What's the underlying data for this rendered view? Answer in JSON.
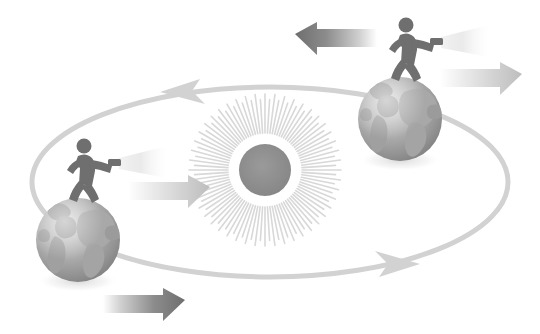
{
  "diagram": {
    "canvas": {
      "width": 540,
      "height": 334,
      "background": "#ffffff"
    },
    "palette": {
      "background": "#ffffff",
      "orbit_line": "#d2d2d2",
      "sun_core": "#8c8c8c",
      "sun_rays": "#d8d8d8",
      "globe_ocean_light": "#c9c9c9",
      "globe_ocean_dark": "#8e8e8e",
      "globe_land": "#a7a7a7",
      "figure_body": "#6f6f6f",
      "arrow_dark": "#777777",
      "arrow_mid": "#9b9b9b",
      "arrow_light": "#c4c4c4",
      "beam_light": "#e8e8e8",
      "shadow": "#e6e6e6"
    },
    "sun": {
      "label": "Sun",
      "center_x": 265,
      "center_y": 170,
      "core_radius": 26,
      "ray_inner_radius": 37,
      "ray_outer_radius": 76,
      "ray_count": 96
    },
    "orbit": {
      "label": "Orbit path",
      "center_x": 270,
      "center_y": 182,
      "radius_x": 238,
      "radius_y": 95,
      "stroke_width": 5,
      "direction": "counterclockwise",
      "arrowheads": [
        {
          "name": "orbit-arrow-top",
          "position_x": 179,
          "position_y": 90,
          "points": "left"
        },
        {
          "name": "orbit-arrow-bottom",
          "position_x": 397,
          "position_y": 262,
          "points": "right"
        }
      ]
    },
    "earths": [
      {
        "name": "earth-far",
        "label": "Earth (far side of orbit)",
        "center_x": 400,
        "center_y": 119,
        "radius": 42,
        "figure": {
          "label": "Person with flashlight",
          "facing": "right",
          "base_x": 404,
          "base_y": 79,
          "scale": 1.0
        },
        "beam": {
          "label": "Flashlight beam",
          "direction": "right",
          "origin_x": 441,
          "origin_y": 42,
          "length": 46
        }
      },
      {
        "name": "earth-near",
        "label": "Earth (near side of orbit)",
        "center_x": 78,
        "center_y": 240,
        "radius": 42,
        "figure": {
          "label": "Person with flashlight",
          "facing": "right",
          "base_x": 82,
          "base_y": 200,
          "scale": 1.0
        },
        "beam": {
          "label": "Flashlight beam",
          "direction": "right",
          "origin_x": 119,
          "origin_y": 163,
          "length": 46
        }
      }
    ],
    "arrows": [
      {
        "name": "arrow-top-left-pointing",
        "label": "Leftward motion arrow (far Earth)",
        "direction": "left",
        "x": 295,
        "y": 34,
        "width": 82,
        "height": 24,
        "tone": "dark",
        "fade": "tail-right"
      },
      {
        "name": "arrow-top-right-pointing",
        "label": "Rightward light arrow (far Earth)",
        "direction": "right",
        "x": 440,
        "y": 63,
        "width": 82,
        "height": 24,
        "tone": "light",
        "fade": "tail-left"
      },
      {
        "name": "arrow-middle-right-pointing",
        "label": "Rightward light arrow (near Earth)",
        "direction": "right",
        "x": 128,
        "y": 176,
        "width": 82,
        "height": 24,
        "tone": "light",
        "fade": "tail-left"
      },
      {
        "name": "arrow-bottom-right-pointing",
        "label": "Rightward motion arrow (near Earth)",
        "direction": "right",
        "x": 103,
        "y": 289,
        "width": 82,
        "height": 24,
        "tone": "dark",
        "fade": "tail-left"
      }
    ]
  }
}
